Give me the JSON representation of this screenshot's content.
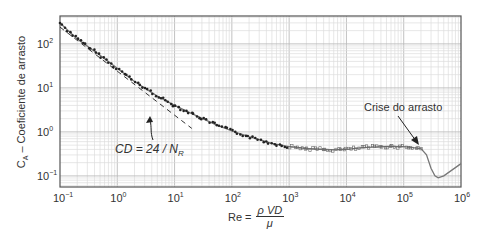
{
  "chart_data": {
    "type": "line",
    "title": "",
    "xlabel": "Re = ρVD / μ",
    "ylabel": "C_A – Coeficiente de arrasto",
    "xscale": "log",
    "yscale": "log",
    "xlim": [
      0.1,
      1000000
    ],
    "ylim": [
      0.056,
      430
    ],
    "grid": true,
    "x_ticks": [
      "10^-1",
      "10^0",
      "10^1",
      "10^2",
      "10^3",
      "10^4",
      "10^5",
      "10^6"
    ],
    "y_ticks": [
      "10^-1",
      "10^0",
      "10^1",
      "10^2"
    ],
    "series": [
      {
        "name": "Dados experimentais (esfera)",
        "style": "markers+line",
        "x": [
          0.1,
          0.2,
          0.5,
          1,
          2,
          5,
          10,
          20,
          50,
          100,
          200,
          500,
          1000,
          2000,
          5000,
          10000,
          20000,
          50000,
          100000,
          200000,
          250000,
          300000,
          350000,
          400000,
          500000,
          1000000
        ],
        "y": [
          300,
          130,
          55,
          28,
          14,
          6.5,
          4.0,
          2.6,
          1.5,
          1.05,
          0.78,
          0.55,
          0.46,
          0.42,
          0.39,
          0.4,
          0.44,
          0.47,
          0.46,
          0.42,
          0.3,
          0.15,
          0.1,
          0.09,
          0.1,
          0.19
        ]
      },
      {
        "name": "CD = 24 / NR",
        "style": "dashed",
        "x": [
          0.1,
          1,
          10,
          20
        ],
        "y": [
          240,
          24,
          2.4,
          1.2
        ]
      }
    ],
    "annotations": [
      {
        "text": "CD = 24 / NR",
        "points_to": "Stokes line"
      },
      {
        "text": "Crise do arrasto",
        "points_to": [
          200000,
          0.42
        ]
      }
    ]
  },
  "labels": {
    "x_ticks": [
      {
        "base": "10",
        "exp": "−1"
      },
      {
        "base": "10",
        "exp": "0"
      },
      {
        "base": "10",
        "exp": "1"
      },
      {
        "base": "10",
        "exp": "2"
      },
      {
        "base": "10",
        "exp": "3"
      },
      {
        "base": "10",
        "exp": "4"
      },
      {
        "base": "10",
        "exp": "5"
      },
      {
        "base": "10",
        "exp": "6"
      }
    ],
    "y_ticks": [
      {
        "base": "10",
        "exp": "2"
      },
      {
        "base": "10",
        "exp": "1"
      },
      {
        "base": "10",
        "exp": "0"
      },
      {
        "base": "10",
        "exp": "−1"
      }
    ],
    "ylabel_main": "C",
    "ylabel_sub": "A",
    "ylabel_rest": " – Coeficiente de arrasto",
    "xlabel_prefix": "Re =",
    "xlabel_num": "ρ VD",
    "xlabel_den": "μ",
    "stokes_label": "CD = 24 / N",
    "stokes_sub": "R",
    "crise_label": "Crise do arrasto"
  }
}
